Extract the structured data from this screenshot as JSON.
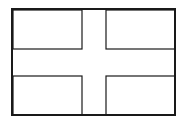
{
  "figure": {
    "stroke_color": "#1a1a1a",
    "fill_color": "#ffffff",
    "outer_frame": {
      "x": 12,
      "y": 9,
      "w": 163,
      "h": 106,
      "stroke": 2
    },
    "panels": [
      {
        "name": "top-left",
        "x": 13,
        "y": 10,
        "w": 69,
        "h": 39
      },
      {
        "name": "top-right",
        "x": 106,
        "y": 10,
        "w": 69,
        "h": 39
      },
      {
        "name": "bottom-left",
        "x": 13,
        "y": 76,
        "w": 69,
        "h": 39
      },
      {
        "name": "bottom-right",
        "x": 106,
        "y": 76,
        "w": 69,
        "h": 39
      }
    ]
  }
}
